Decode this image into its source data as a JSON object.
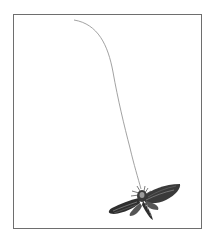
{
  "illustration": {
    "subject": "moth-hanging-on-thread",
    "colors": {
      "background": "#ffffff",
      "frame": "#6e6e6e",
      "thread": "#8a8a8a",
      "moth_dark": "#2a2a2a",
      "moth_mid": "#6a6a6a",
      "moth_light": "#b5b5b5"
    }
  }
}
